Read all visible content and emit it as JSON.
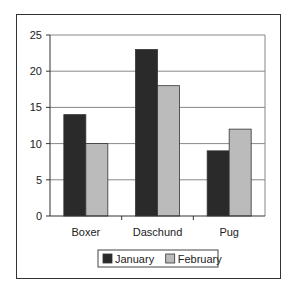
{
  "chart_data": {
    "type": "bar",
    "title": "",
    "xlabel": "",
    "ylabel": "",
    "categories": [
      "Boxer",
      "Daschund",
      "Pug"
    ],
    "series": [
      {
        "name": "January",
        "values": [
          14,
          23,
          9
        ],
        "color": "#2a2a2a"
      },
      {
        "name": "February",
        "values": [
          10,
          18,
          12
        ],
        "color": "#bbbbbb"
      }
    ],
    "ylim": [
      0,
      25
    ],
    "yticks": [
      0,
      5,
      10,
      15,
      20,
      25
    ],
    "grid": true,
    "legend_position": "bottom"
  }
}
